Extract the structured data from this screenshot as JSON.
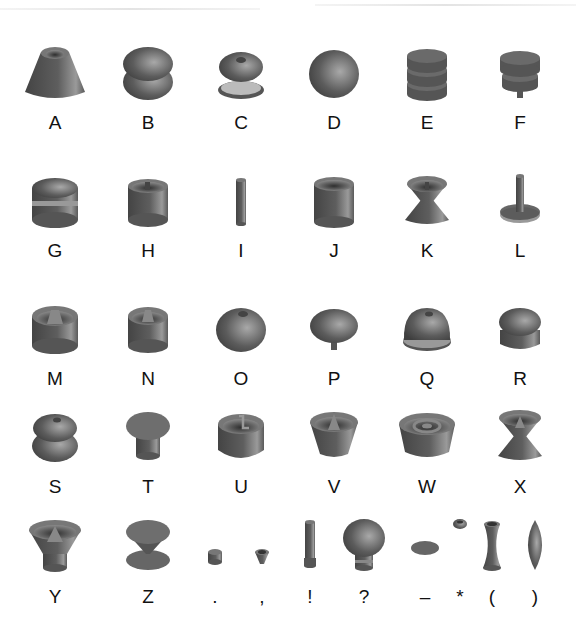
{
  "figure": {
    "rows": [
      {
        "y": 40,
        "items": [
          {
            "label": "A",
            "shape": "truncated-cone-with-hollow-top"
          },
          {
            "label": "B",
            "shape": "stacked-rounded-disks"
          },
          {
            "label": "C",
            "shape": "torus-over-dish"
          },
          {
            "label": "D",
            "shape": "sphere"
          },
          {
            "label": "E",
            "shape": "three-stacked-disks"
          },
          {
            "label": "F",
            "shape": "two-stacked-disks-with-peg"
          }
        ]
      },
      {
        "y": 168,
        "items": [
          {
            "label": "G",
            "shape": "banded-cylinder-dimpled-top"
          },
          {
            "label": "H",
            "shape": "hollow-cylinder-with-post"
          },
          {
            "label": "I",
            "shape": "thin-rod"
          },
          {
            "label": "J",
            "shape": "hollow-cup-cylinder"
          },
          {
            "label": "K",
            "shape": "hourglass-with-hollow-top"
          },
          {
            "label": "L",
            "shape": "rod-on-disk-base"
          }
        ]
      },
      {
        "y": 296,
        "items": [
          {
            "label": "M",
            "shape": "hollow-cylinder-with-cone"
          },
          {
            "label": "N",
            "shape": "hollow-cylinder-with-cone-small"
          },
          {
            "label": "O",
            "shape": "dimpled-sphere"
          },
          {
            "label": "P",
            "shape": "mushroom-cap-with-peg"
          },
          {
            "label": "Q",
            "shape": "dimpled-dome-on-base"
          },
          {
            "label": "R",
            "shape": "rounded-stack"
          }
        ]
      },
      {
        "y": 404,
        "items": [
          {
            "label": "S",
            "shape": "double-torus-stack"
          },
          {
            "label": "T",
            "shape": "disk-on-cylinder"
          },
          {
            "label": "U",
            "shape": "hollow-cylinder-with-hook"
          },
          {
            "label": "V",
            "shape": "inverted-cone-cup-with-spike"
          },
          {
            "label": "W",
            "shape": "cup-with-nested-rings"
          },
          {
            "label": "X",
            "shape": "hourglass-cup-with-cone"
          }
        ]
      },
      {
        "y": 514,
        "items": [
          {
            "label": "Y",
            "shape": "funnel-cup-with-cone"
          },
          {
            "label": "Z",
            "shape": "disk-cone-disk"
          },
          {
            "label": ".",
            "shape": "small-puck"
          },
          {
            "label": ",",
            "shape": "small-cone-cup"
          },
          {
            "label": "!",
            "shape": "tall-rod-with-base"
          },
          {
            "label": "?",
            "shape": "bulb-on-neck"
          },
          {
            "label": "–",
            "shape": "flat-disk"
          },
          {
            "label": "*",
            "shape": "small-bead"
          },
          {
            "label": "(",
            "shape": "hyperboloid-spool"
          },
          {
            "label": ")",
            "shape": "spindle"
          }
        ]
      }
    ]
  },
  "colors": {
    "shape_dark": "#4a4a4a",
    "shape_mid": "#6e6e6e",
    "shape_light": "#b5b5b5",
    "label": "#111111",
    "background": "#ffffff"
  }
}
